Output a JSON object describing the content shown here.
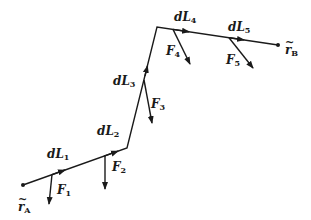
{
  "diagram": {
    "title": "",
    "type": "line-segment path with force vectors",
    "colors": {
      "line": "#1a1a1a",
      "background": "#ffffff"
    },
    "endpoints": [
      {
        "id": "rA",
        "symbol": "r",
        "subscript": "A",
        "label": "~r_A"
      },
      {
        "id": "rB",
        "symbol": "r",
        "subscript": "B",
        "label": "~r_B"
      }
    ],
    "segments": [
      {
        "id": "dL1",
        "symbol": "dL",
        "subscript": "1"
      },
      {
        "id": "dL2",
        "symbol": "dL",
        "subscript": "2"
      },
      {
        "id": "dL3",
        "symbol": "dL",
        "subscript": "3"
      },
      {
        "id": "dL4",
        "symbol": "dL",
        "subscript": "4"
      },
      {
        "id": "dL5",
        "symbol": "dL",
        "subscript": "5"
      }
    ],
    "forces": [
      {
        "id": "F1",
        "symbol": "F",
        "subscript": "1"
      },
      {
        "id": "F2",
        "symbol": "F",
        "subscript": "2"
      },
      {
        "id": "F3",
        "symbol": "F",
        "subscript": "3"
      },
      {
        "id": "F4",
        "symbol": "F",
        "subscript": "4"
      },
      {
        "id": "F5",
        "symbol": "F",
        "subscript": "5"
      }
    ]
  }
}
